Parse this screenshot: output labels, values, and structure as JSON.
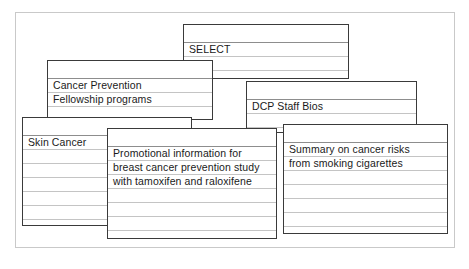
{
  "frame": {
    "name": "outer-frame",
    "border_color": "#c9c9c9",
    "background": "#ffffff"
  },
  "style": {
    "card_border_color": "#3a3a3a",
    "rule_color": "#c4c4c4",
    "rule_strong_color": "#8d8d8d",
    "text_color": "#1a1a1a"
  },
  "cards": [
    {
      "id": "select",
      "title": "SELECT",
      "lines": [
        "SELECT"
      ],
      "x": 183,
      "y": 24,
      "w": 166,
      "h": 55,
      "first_rule": 17,
      "rule_gap": 14,
      "rule_count": 4,
      "text_top": 17,
      "z": 1
    },
    {
      "id": "cancer-prevention",
      "title": "Cancer Prevention Fellowship programs",
      "lines": [
        "Cancer Prevention",
        "Fellowship programs"
      ],
      "x": 47,
      "y": 60,
      "w": 166,
      "h": 60,
      "first_rule": 17,
      "rule_gap": 14,
      "rule_count": 4,
      "text_top": 17,
      "z": 2
    },
    {
      "id": "dcp-staff-bios",
      "title": "DCP Staff Bios",
      "lines": [
        "DCP Staff Bios"
      ],
      "x": 246,
      "y": 81,
      "w": 171,
      "h": 52,
      "first_rule": 17,
      "rule_gap": 14,
      "rule_count": 3,
      "text_top": 17,
      "z": 3
    },
    {
      "id": "skin-cancer",
      "title": "Skin Cancer",
      "lines": [
        "Skin Cancer"
      ],
      "x": 22,
      "y": 117,
      "w": 170,
      "h": 109,
      "first_rule": 17,
      "rule_gap": 14,
      "rule_count": 7,
      "text_top": 17,
      "z": 4
    },
    {
      "id": "summary-smoking",
      "title": "Summary on cancer risks from smoking cigarettes",
      "lines": [
        "Summary on cancer risks",
        "from smoking cigarettes"
      ],
      "x": 283,
      "y": 124,
      "w": 165,
      "h": 110,
      "first_rule": 17,
      "rule_gap": 14,
      "rule_count": 7,
      "text_top": 17,
      "z": 5
    },
    {
      "id": "promotional-tamoxifen",
      "title": "Promotional information for breast cancer prevention study with tamoxifen and raloxifene",
      "lines": [
        "Promotional information for",
        "breast cancer prevention study",
        "with tamoxifen and raloxifene"
      ],
      "x": 107,
      "y": 128,
      "w": 170,
      "h": 111,
      "first_rule": 17,
      "rule_gap": 14,
      "rule_count": 7,
      "text_top": 17,
      "z": 6
    }
  ]
}
